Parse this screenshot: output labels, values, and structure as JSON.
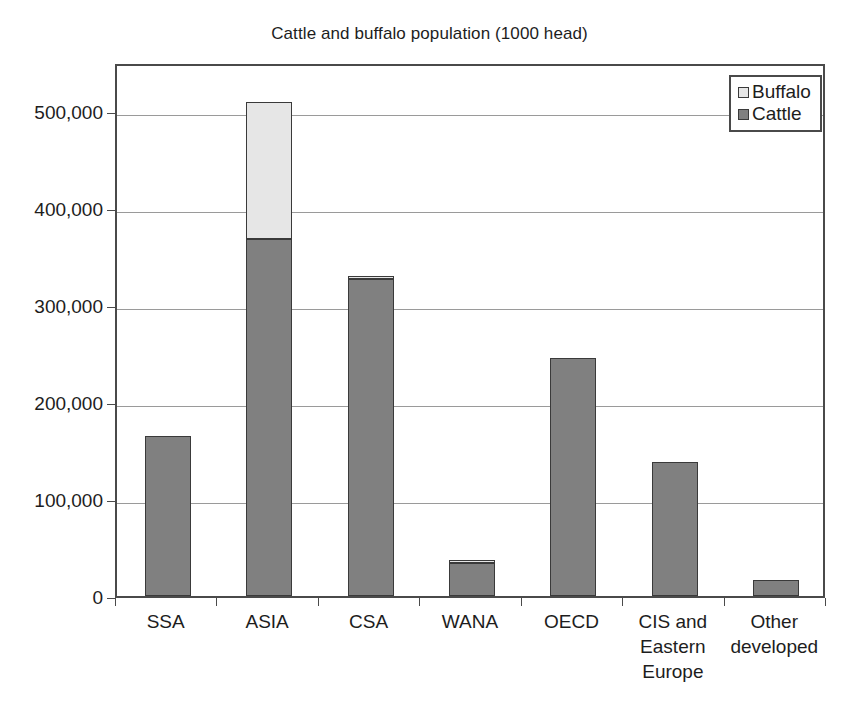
{
  "chart_data": {
    "type": "bar",
    "title": "Cattle and buffalo population (1000 head)",
    "subtitle": "",
    "xlabel": "",
    "ylabel": "",
    "stacked": true,
    "grid": true,
    "legend_position": "top-right",
    "ylim": [
      0,
      550000
    ],
    "yticks": [
      0,
      100000,
      200000,
      300000,
      400000,
      500000
    ],
    "ytick_labels": [
      "0",
      "100,000",
      "200,000",
      "300,000",
      "400,000",
      "500,000"
    ],
    "categories": [
      "SSA",
      "ASIA",
      "CSA",
      "WANA",
      "OECD",
      "CIS and Eastern Europe",
      "Other developed"
    ],
    "category_label_lines": [
      [
        "SSA"
      ],
      [
        "ASIA"
      ],
      [
        "CSA"
      ],
      [
        "WANA"
      ],
      [
        "OECD"
      ],
      [
        "CIS and",
        "Eastern",
        "Europe"
      ],
      [
        "Other",
        "developed"
      ]
    ],
    "series": [
      {
        "name": "Cattle",
        "color": "#808080",
        "values": [
          165000,
          368000,
          327000,
          34000,
          245000,
          138000,
          16000
        ]
      },
      {
        "name": "Buffalo",
        "color": "#e6e6e6",
        "values": [
          0,
          141000,
          3000,
          3000,
          0,
          0,
          0
        ]
      }
    ],
    "totals": [
      165000,
      509000,
      330000,
      37000,
      245000,
      138000,
      16000
    ]
  },
  "legend": {
    "items": [
      {
        "label": "Buffalo",
        "color": "#e6e6e6"
      },
      {
        "label": "Cattle",
        "color": "#808080"
      }
    ]
  },
  "colors": {
    "cattle": "#808080",
    "buffalo": "#e6e6e6",
    "axis": "#4a4a4a",
    "gridline": "#9a9a9a",
    "text": "#1d1d1d",
    "background": "#ffffff"
  }
}
